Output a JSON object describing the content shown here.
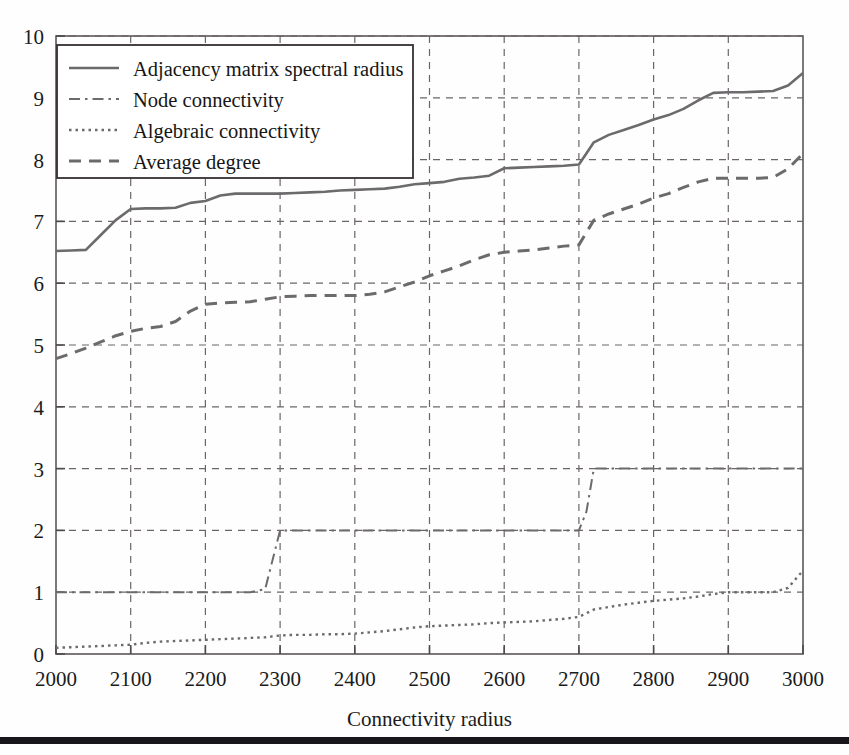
{
  "figure": {
    "background_color": "#fefefe",
    "axis_color": "#666064",
    "grid_color": "#6b6569",
    "line_color": "#6d6a6d",
    "text_color": "#1b1b1b",
    "rule_color": "#18161a"
  },
  "axes": {
    "x": {
      "label": "Connectivity radius",
      "min": 2000,
      "max": 3000,
      "ticks": [
        2000,
        2100,
        2200,
        2300,
        2400,
        2500,
        2600,
        2700,
        2800,
        2900,
        3000
      ],
      "tick_labels": [
        "2000",
        "2100",
        "2200",
        "2300",
        "2400",
        "2500",
        "2600",
        "2700",
        "2800",
        "2900",
        "3000"
      ]
    },
    "y": {
      "label": "",
      "min": 0,
      "max": 10,
      "ticks": [
        0,
        1,
        2,
        3,
        4,
        5,
        6,
        7,
        8,
        9,
        10
      ],
      "tick_labels": [
        "0",
        "1",
        "2",
        "3",
        "4",
        "5",
        "6",
        "7",
        "8",
        "9",
        "10"
      ]
    },
    "grid": "both-dashed"
  },
  "legend": {
    "position": "upper-left",
    "entries": [
      {
        "label": "Adjacency matrix spectral radius",
        "style": "solid",
        "dash": "none"
      },
      {
        "label": "Node connectivity",
        "style": "dash-dot",
        "dash": "10 5 2 5"
      },
      {
        "label": "Algebraic connectivity",
        "style": "dotted",
        "dash": "2.5 4"
      },
      {
        "label": "Average degree",
        "style": "dashed",
        "dash": "11 8"
      }
    ]
  },
  "chart_data": {
    "type": "line",
    "title": "",
    "xlabel": "Connectivity radius",
    "ylabel": "",
    "xlim": [
      2000,
      3000
    ],
    "ylim": [
      0,
      10
    ],
    "grid": true,
    "legend_position": "upper-left",
    "x": [
      2000,
      2020,
      2040,
      2060,
      2080,
      2100,
      2120,
      2140,
      2160,
      2180,
      2200,
      2220,
      2240,
      2260,
      2280,
      2300,
      2320,
      2340,
      2360,
      2380,
      2400,
      2420,
      2440,
      2460,
      2480,
      2500,
      2520,
      2540,
      2560,
      2580,
      2600,
      2620,
      2640,
      2660,
      2680,
      2700,
      2710,
      2720,
      2740,
      2760,
      2780,
      2800,
      2820,
      2840,
      2860,
      2880,
      2900,
      2920,
      2940,
      2960,
      2980,
      3000
    ],
    "series": [
      {
        "name": "Adjacency matrix spectral radius",
        "style": "solid",
        "values": [
          6.52,
          6.53,
          6.54,
          6.78,
          7.02,
          7.2,
          7.21,
          7.21,
          7.22,
          7.3,
          7.33,
          7.42,
          7.45,
          7.45,
          7.45,
          7.45,
          7.46,
          7.47,
          7.48,
          7.5,
          7.51,
          7.52,
          7.53,
          7.56,
          7.6,
          7.62,
          7.64,
          7.69,
          7.71,
          7.74,
          7.86,
          7.87,
          7.88,
          7.89,
          7.9,
          7.92,
          8.1,
          8.28,
          8.4,
          8.48,
          8.56,
          8.65,
          8.72,
          8.82,
          8.96,
          9.08,
          9.09,
          9.09,
          9.1,
          9.11,
          9.2,
          9.4
        ]
      },
      {
        "name": "Node connectivity",
        "style": "dash-dot",
        "values": [
          1,
          1,
          1,
          1,
          1,
          1,
          1,
          1,
          1,
          1,
          1,
          1,
          1,
          1,
          1.05,
          2,
          2,
          2,
          2,
          2,
          2,
          2,
          2,
          2,
          2,
          2,
          2,
          2,
          2,
          2,
          2,
          2,
          2,
          2,
          2,
          2,
          2.3,
          3,
          3,
          3,
          3,
          3,
          3,
          3,
          3,
          3,
          3,
          3,
          3,
          3,
          3,
          3
        ]
      },
      {
        "name": "Algebraic connectivity",
        "style": "dotted",
        "values": [
          0.1,
          0.11,
          0.12,
          0.13,
          0.14,
          0.15,
          0.18,
          0.2,
          0.21,
          0.22,
          0.23,
          0.24,
          0.25,
          0.26,
          0.27,
          0.3,
          0.31,
          0.31,
          0.32,
          0.32,
          0.33,
          0.35,
          0.37,
          0.4,
          0.43,
          0.45,
          0.46,
          0.47,
          0.48,
          0.5,
          0.51,
          0.52,
          0.53,
          0.55,
          0.57,
          0.6,
          0.66,
          0.72,
          0.76,
          0.8,
          0.83,
          0.86,
          0.88,
          0.9,
          0.93,
          0.97,
          1.0,
          1.0,
          1.0,
          1.0,
          1.07,
          1.35
        ]
      },
      {
        "name": "Average degree",
        "style": "dashed",
        "values": [
          4.78,
          4.86,
          4.95,
          5.05,
          5.15,
          5.22,
          5.27,
          5.3,
          5.38,
          5.55,
          5.66,
          5.68,
          5.69,
          5.7,
          5.74,
          5.78,
          5.79,
          5.8,
          5.8,
          5.8,
          5.8,
          5.82,
          5.86,
          5.94,
          6.02,
          6.12,
          6.2,
          6.28,
          6.38,
          6.46,
          6.5,
          6.52,
          6.54,
          6.57,
          6.6,
          6.62,
          6.82,
          7.02,
          7.12,
          7.2,
          7.28,
          7.38,
          7.45,
          7.55,
          7.64,
          7.7,
          7.7,
          7.7,
          7.7,
          7.71,
          7.85,
          8.1
        ]
      }
    ]
  }
}
